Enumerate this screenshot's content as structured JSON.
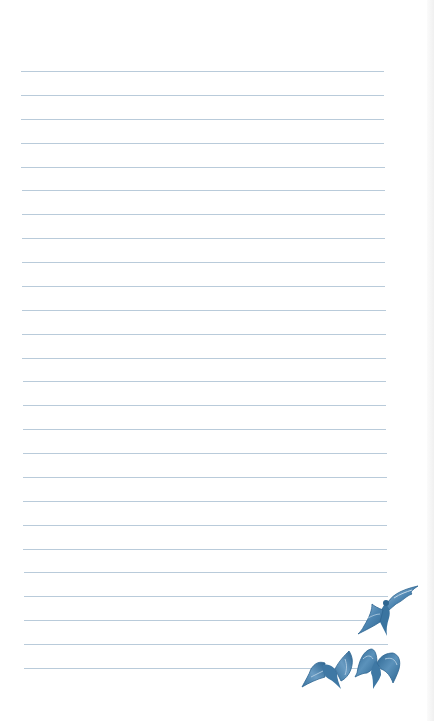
{
  "page": {
    "type": "lined-notepaper",
    "background_color": "#ffffff",
    "edge_color": "#f0f0f0"
  },
  "ruled_lines": {
    "count": 26,
    "first_y": 71,
    "spacing": 23.88,
    "x_start_top": 21,
    "x_end_top": 384,
    "x_start_bottom": 24,
    "x_end_bottom": 388,
    "color": "#b9cbda"
  },
  "illustration": {
    "description": "three blue birds in flight",
    "colors": {
      "dark": "#2d6591",
      "mid": "#4e86b2",
      "light": "#9dbfd8"
    },
    "birds": [
      {
        "name": "bird-top-right",
        "x": 358,
        "y": 584,
        "w": 62,
        "h": 52
      },
      {
        "name": "bird-bottom-left",
        "x": 302,
        "y": 650,
        "w": 52,
        "h": 40
      },
      {
        "name": "bird-bottom-right",
        "x": 354,
        "y": 646,
        "w": 48,
        "h": 44
      }
    ]
  }
}
